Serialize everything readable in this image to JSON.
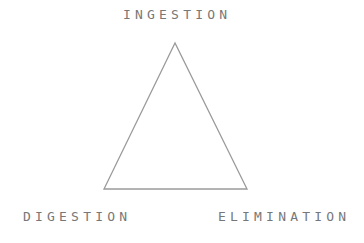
{
  "diagram": {
    "type": "triangle",
    "nodes": {
      "top": "INGESTION",
      "bottom_left": "DIGESTION",
      "bottom_right": "ELIMINATION"
    },
    "stroke_color": "#9a9a9a",
    "text_color": "#777777"
  }
}
